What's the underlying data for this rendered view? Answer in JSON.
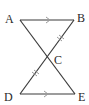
{
  "diagram": {
    "points": {
      "A": {
        "label": "A",
        "x": 20,
        "y": 20
      },
      "B": {
        "label": "B",
        "x": 74,
        "y": 20
      },
      "C": {
        "label": "C",
        "x": 48,
        "y": 57
      },
      "D": {
        "label": "D",
        "x": 20,
        "y": 94
      },
      "E": {
        "label": "E",
        "x": 75,
        "y": 94
      }
    },
    "segments": [
      "AB",
      "AE",
      "BD",
      "DE"
    ],
    "markings": {
      "parallel_arrows": [
        "AB",
        "DE"
      ],
      "equal_ticks": [
        "BC",
        "CD"
      ]
    },
    "colors": {
      "line": "#3a3a3a",
      "marks": "#9a9a9a"
    }
  }
}
